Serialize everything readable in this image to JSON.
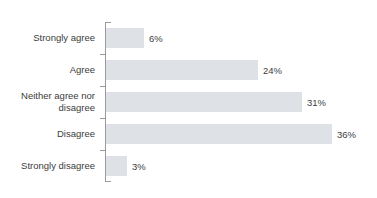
{
  "chart_data": {
    "type": "bar",
    "orientation": "horizontal",
    "title": "decisions",
    "title_full_visible_text": "decisions",
    "xlabel": "",
    "ylabel": "",
    "grid": false,
    "legend": null,
    "axis_line_color": "#9a9a9a",
    "bar_color": "#dee2e6",
    "text_color": "#3c3c3c",
    "xlim": [
      0,
      40
    ],
    "categories": [
      "Strongly agree",
      "Agree",
      "Neither agree nor disagree",
      "Disagree",
      "Strongly disagree"
    ],
    "values": [
      6,
      24,
      31,
      36,
      3
    ],
    "data_labels": [
      "6%",
      "24%",
      "31%",
      "36%",
      "3%"
    ],
    "bars": [
      {
        "label": "Strongly agree",
        "value": 6,
        "data_label": "6%",
        "bar_px": 38
      },
      {
        "label": "Agree",
        "value": 24,
        "data_label": "24%",
        "bar_px": 152
      },
      {
        "label": "Neither agree nor\ndisagree",
        "value": 31,
        "data_label": "31%",
        "bar_px": 196
      },
      {
        "label": "Disagree",
        "value": 36,
        "data_label": "36%",
        "bar_px": 226
      },
      {
        "label": "Strongly disagree",
        "value": 3,
        "data_label": "3%",
        "bar_px": 21
      }
    ]
  }
}
